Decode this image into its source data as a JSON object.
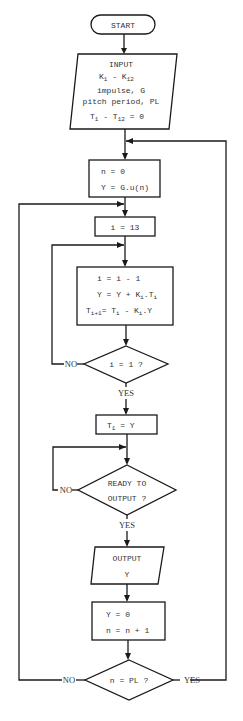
{
  "diagram": {
    "type": "flowchart",
    "start": {
      "label": "START"
    },
    "input": {
      "title": "INPUT",
      "k_range": {
        "base": "K",
        "from": "1",
        "sep": " - ",
        "to_base": "K",
        "to": "12"
      },
      "line_impulse": "impulse, G",
      "line_pitch": "pitch period, PL",
      "t_init": {
        "base": "T",
        "from": "1",
        "sep": " - ",
        "to_base": "T",
        "to": "12",
        "suffix": " = 0"
      }
    },
    "init_box": {
      "line1": "n = 0",
      "line2": "Y = G.u(n)"
    },
    "i_init": {
      "label": "i = 13"
    },
    "lattice_box": {
      "line1": "i = i - 1",
      "line2": {
        "pre": "Y = Y + K",
        "s1": "i",
        "mid": ".T",
        "s2": "i"
      },
      "line3": {
        "pre": "T",
        "s1": "i+1",
        "mid": "= T",
        "s2": "i",
        "mid2": " - K",
        "s3": "i",
        "post": ".Y"
      }
    },
    "decision_i": {
      "label": "i = 1 ?",
      "no": "NO",
      "yes": "YES"
    },
    "t1_box": {
      "pre": "T",
      "sub": "1",
      "post": " = Y"
    },
    "decision_ready": {
      "line1": "READY TO",
      "line2": "OUTPUT ?",
      "no": "NO",
      "yes": "YES"
    },
    "output": {
      "line1": "OUTPUT",
      "line2": "Y"
    },
    "reset_box": {
      "line1": "Y = 0",
      "line2": "n = n + 1"
    },
    "decision_pl": {
      "label": "n = PL ?",
      "no": "NO",
      "yes": "YES"
    }
  }
}
